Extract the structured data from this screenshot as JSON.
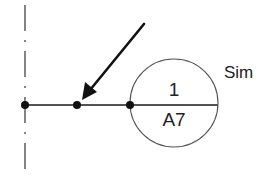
{
  "diagram": {
    "type": "section-callout",
    "callout": {
      "number": "1",
      "sheet": "A7",
      "side_label": "Sim"
    },
    "colors": {
      "line": "#1a1a1a",
      "circle": "#555555",
      "background": "#ffffff"
    },
    "elements": {
      "centerline": "dash-dot vertical line",
      "leader": "horizontal line with three nodes",
      "arrow": "diagonal arrow pointing to middle node"
    }
  }
}
